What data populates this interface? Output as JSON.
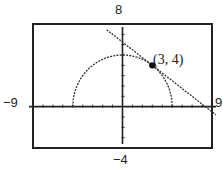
{
  "chart_data": {
    "type": "line",
    "title": "",
    "xlabel": "",
    "ylabel": "",
    "xlim": [
      -9,
      9
    ],
    "ylim": [
      -4,
      8
    ],
    "xscale": 1,
    "yscale": 1,
    "grid": false,
    "window_labels": {
      "xmin": "−9",
      "xmax": "9",
      "ymin": "−4",
      "ymax": "8"
    },
    "series": [
      {
        "name": "semicircle",
        "equation": "y = sqrt(25 - x^2)",
        "style": "dotted"
      },
      {
        "name": "tangent line",
        "equation": "y = -3/4 x + 25/4",
        "style": "dotted"
      }
    ],
    "annotations": [
      {
        "text": "(3, 4)",
        "x": 3,
        "y": 4,
        "marker": "filled-circle"
      }
    ]
  }
}
